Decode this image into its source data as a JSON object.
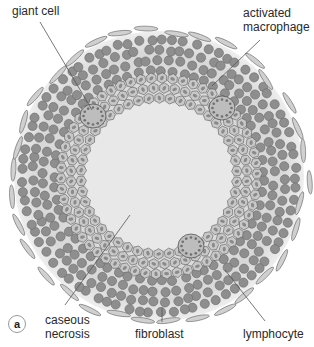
{
  "figure": {
    "panel_letter": "a",
    "colors": {
      "background": "#ffffff",
      "outer_zone": "#dcdcdc",
      "necrosis_core": "#e8e8e8",
      "lymphocyte_fill": "#8e8e8e",
      "lymphocyte_stroke": "#6a6a6a",
      "macrophage_fill": "#c8c8c8",
      "macrophage_nucleus": "#8a8a8a",
      "fibroblast_fill": "#d0d0d0",
      "fibroblast_stroke": "#777777",
      "leader_line": "#555555",
      "label_text": "#2a2a2a"
    },
    "geometry": {
      "center": [
        159,
        176
      ],
      "outer_radius": 145,
      "core_radius": 72,
      "macrophage_ring_outer": 100,
      "giant_cells": [
        [
          93,
          116
        ],
        [
          222,
          108
        ],
        [
          191,
          246
        ]
      ]
    },
    "labels": [
      {
        "id": "giant-cell",
        "lines": [
          "giant cell"
        ],
        "x": 12,
        "y": 4,
        "line_from": [
          40,
          22
        ],
        "line_to": [
          92,
          110
        ]
      },
      {
        "id": "activated-macrophage",
        "lines": [
          "activated",
          "macrophage"
        ],
        "x": 243,
        "y": 6,
        "line_from": [
          260,
          40
        ],
        "line_to": [
          212,
          86
        ]
      },
      {
        "id": "caseous-necrosis",
        "lines": [
          "caseous",
          "necrosis"
        ],
        "x": 45,
        "y": 313,
        "line_from": [
          65,
          305
        ],
        "line_to": [
          130,
          215
        ]
      },
      {
        "id": "fibroblast",
        "lines": [
          "fibroblast"
        ],
        "x": 135,
        "y": 327,
        "line_from": [
          162,
          322
        ],
        "line_to": [
          162,
          308
        ]
      },
      {
        "id": "lymphocyte",
        "lines": [
          "lymphocyte"
        ],
        "x": 243,
        "y": 327,
        "line_from": [
          265,
          321
        ],
        "line_to": [
          225,
          270
        ]
      }
    ]
  }
}
